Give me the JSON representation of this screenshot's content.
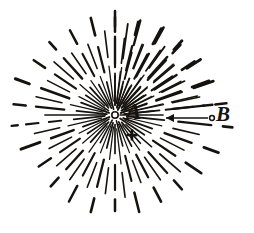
{
  "figure": {
    "kind": "engraving-diagram",
    "background_color": "#ffffff",
    "ink_color": "#16130f",
    "width": 254,
    "height": 233,
    "center": {
      "x": 115,
      "y": 115
    }
  },
  "labels": {
    "center_label": "A",
    "outer_label": "B"
  },
  "markers": {
    "center_node": {
      "name": "center-circle",
      "cx": 115,
      "cy": 115,
      "r": 3.2
    },
    "outer_node": {
      "name": "outer-circle",
      "cx": 212,
      "cy": 118,
      "r": 2.4
    },
    "plus_marker": {
      "name": "plus-marker",
      "x": 132,
      "y": 135,
      "size": 11
    }
  },
  "arrow": {
    "name": "direction-arrow",
    "from_x": 209,
    "from_y": 118,
    "to_x": 166,
    "to_y": 118,
    "head_length": 8,
    "head_width": 4
  },
  "chart_data": {
    "type": "scatter",
    "title": "",
    "xlabel": "",
    "ylabel": "",
    "rays": [
      {
        "angle": -90,
        "length": 104,
        "dashes": [
          [
            0.1,
            0.4
          ],
          [
            0.46,
            0.74
          ],
          [
            0.8,
            1.0
          ]
        ],
        "w": 1.5
      },
      {
        "angle": -82,
        "length": 92,
        "dashes": [
          [
            0.14,
            0.52
          ],
          [
            0.62,
            1.0
          ]
        ],
        "w": 1.1
      },
      {
        "angle": -75,
        "length": 98,
        "dashes": [
          [
            0.08,
            0.3
          ],
          [
            0.38,
            0.66
          ],
          [
            0.74,
            1.0
          ]
        ],
        "w": 1.4
      },
      {
        "angle": -68,
        "length": 86,
        "dashes": [
          [
            0.12,
            0.46
          ],
          [
            0.58,
            0.88
          ]
        ],
        "w": 1.0
      },
      {
        "angle": -61,
        "length": 100,
        "dashes": [
          [
            0.06,
            0.34
          ],
          [
            0.44,
            0.7
          ],
          [
            0.82,
            1.0
          ]
        ],
        "w": 1.6
      },
      {
        "angle": -54,
        "length": 88,
        "dashes": [
          [
            0.16,
            0.56
          ],
          [
            0.66,
            0.96
          ]
        ],
        "w": 1.1
      },
      {
        "angle": -47,
        "length": 96,
        "dashes": [
          [
            0.1,
            0.38
          ],
          [
            0.5,
            0.78
          ],
          [
            0.88,
            1.0
          ]
        ],
        "w": 1.5
      },
      {
        "angle": -40,
        "length": 84,
        "dashes": [
          [
            0.14,
            0.5
          ],
          [
            0.6,
            0.92
          ]
        ],
        "w": 1.0
      },
      {
        "angle": -33,
        "length": 102,
        "dashes": [
          [
            0.08,
            0.36
          ],
          [
            0.46,
            0.72
          ],
          [
            0.84,
            1.0
          ]
        ],
        "w": 1.7
      },
      {
        "angle": -26,
        "length": 90,
        "dashes": [
          [
            0.12,
            0.48
          ],
          [
            0.58,
            0.86
          ]
        ],
        "w": 1.1
      },
      {
        "angle": -19,
        "length": 104,
        "dashes": [
          [
            0.06,
            0.32
          ],
          [
            0.42,
            0.68
          ],
          [
            0.8,
            1.0
          ]
        ],
        "w": 1.6
      },
      {
        "angle": -12,
        "length": 92,
        "dashes": [
          [
            0.16,
            0.54
          ],
          [
            0.64,
            0.94
          ]
        ],
        "w": 1.0
      },
      {
        "angle": -6,
        "length": 112,
        "dashes": [
          [
            0.08,
            0.4
          ],
          [
            0.52,
            0.8
          ],
          [
            0.9,
            1.0
          ]
        ],
        "w": 1.5
      },
      {
        "angle": 0,
        "length": 48,
        "dashes": [
          [
            0.1,
            1.0
          ]
        ],
        "w": 1.0
      },
      {
        "angle": 6,
        "length": 118,
        "dashes": [
          [
            0.1,
            0.42
          ],
          [
            0.54,
            0.82
          ],
          [
            0.92,
            1.0
          ]
        ],
        "w": 1.6
      },
      {
        "angle": 13,
        "length": 96,
        "dashes": [
          [
            0.14,
            0.5
          ],
          [
            0.62,
            0.9
          ]
        ],
        "w": 1.0
      },
      {
        "angle": 20,
        "length": 110,
        "dashes": [
          [
            0.08,
            0.36
          ],
          [
            0.48,
            0.74
          ],
          [
            0.86,
            1.0
          ]
        ],
        "w": 1.7
      },
      {
        "angle": 27,
        "length": 88,
        "dashes": [
          [
            0.12,
            0.46
          ],
          [
            0.58,
            0.88
          ]
        ],
        "w": 1.0
      },
      {
        "angle": 34,
        "length": 104,
        "dashes": [
          [
            0.06,
            0.34
          ],
          [
            0.44,
            0.7
          ],
          [
            0.82,
            1.0
          ]
        ],
        "w": 1.6
      },
      {
        "angle": 41,
        "length": 90,
        "dashes": [
          [
            0.16,
            0.54
          ],
          [
            0.66,
            0.96
          ]
        ],
        "w": 1.1
      },
      {
        "angle": 48,
        "length": 100,
        "dashes": [
          [
            0.1,
            0.38
          ],
          [
            0.5,
            0.78
          ],
          [
            0.88,
            1.0
          ]
        ],
        "w": 1.5
      },
      {
        "angle": 55,
        "length": 86,
        "dashes": [
          [
            0.14,
            0.5
          ],
          [
            0.6,
            0.92
          ]
        ],
        "w": 1.0
      },
      {
        "angle": 62,
        "length": 98,
        "dashes": [
          [
            0.08,
            0.36
          ],
          [
            0.46,
            0.72
          ],
          [
            0.84,
            1.0
          ]
        ],
        "w": 1.6
      },
      {
        "angle": 69,
        "length": 84,
        "dashes": [
          [
            0.12,
            0.48
          ],
          [
            0.58,
            0.86
          ]
        ],
        "w": 1.0
      },
      {
        "angle": 76,
        "length": 100,
        "dashes": [
          [
            0.06,
            0.32
          ],
          [
            0.42,
            0.68
          ],
          [
            0.8,
            1.0
          ]
        ],
        "w": 1.5
      },
      {
        "angle": 83,
        "length": 88,
        "dashes": [
          [
            0.16,
            0.56
          ],
          [
            0.66,
            0.94
          ]
        ],
        "w": 1.0
      },
      {
        "angle": 90,
        "length": 96,
        "dashes": [
          [
            0.1,
            0.4
          ],
          [
            0.52,
            0.78
          ],
          [
            0.88,
            1.0
          ]
        ],
        "w": 1.5
      },
      {
        "angle": 97,
        "length": 86,
        "dashes": [
          [
            0.14,
            0.52
          ],
          [
            0.62,
            0.92
          ]
        ],
        "w": 1.0
      },
      {
        "angle": 104,
        "length": 100,
        "dashes": [
          [
            0.08,
            0.34
          ],
          [
            0.46,
            0.74
          ],
          [
            0.86,
            1.0
          ]
        ],
        "w": 1.6
      },
      {
        "angle": 111,
        "length": 88,
        "dashes": [
          [
            0.12,
            0.46
          ],
          [
            0.58,
            0.88
          ]
        ],
        "w": 1.0
      },
      {
        "angle": 118,
        "length": 98,
        "dashes": [
          [
            0.06,
            0.32
          ],
          [
            0.44,
            0.7
          ],
          [
            0.82,
            1.0
          ]
        ],
        "w": 1.5
      },
      {
        "angle": 125,
        "length": 84,
        "dashes": [
          [
            0.16,
            0.54
          ],
          [
            0.64,
            0.94
          ]
        ],
        "w": 1.0
      },
      {
        "angle": 132,
        "length": 96,
        "dashes": [
          [
            0.1,
            0.38
          ],
          [
            0.5,
            0.76
          ],
          [
            0.88,
            1.0
          ]
        ],
        "w": 1.6
      },
      {
        "angle": 139,
        "length": 86,
        "dashes": [
          [
            0.14,
            0.5
          ],
          [
            0.6,
            0.9
          ]
        ],
        "w": 1.0
      },
      {
        "angle": 146,
        "length": 92,
        "dashes": [
          [
            0.08,
            0.36
          ],
          [
            0.46,
            0.72
          ],
          [
            0.84,
            1.0
          ]
        ],
        "w": 1.5
      },
      {
        "angle": 153,
        "length": 84,
        "dashes": [
          [
            0.12,
            0.48
          ],
          [
            0.58,
            0.88
          ]
        ],
        "w": 1.0
      },
      {
        "angle": 160,
        "length": 100,
        "dashes": [
          [
            0.06,
            0.34
          ],
          [
            0.44,
            0.68
          ],
          [
            0.8,
            1.0
          ]
        ],
        "w": 1.8
      },
      {
        "angle": 167,
        "length": 86,
        "dashes": [
          [
            0.16,
            0.56
          ],
          [
            0.66,
            0.96
          ]
        ],
        "w": 1.0
      },
      {
        "angle": 174,
        "length": 104,
        "dashes": [
          [
            0.1,
            0.4
          ],
          [
            0.52,
            0.64
          ],
          [
            0.74,
            0.86
          ],
          [
            0.94,
            1.0
          ]
        ],
        "w": 1.4
      },
      {
        "angle": 180,
        "length": 70,
        "dashes": [
          [
            0.14,
            1.0
          ]
        ],
        "w": 1.0
      },
      {
        "angle": 186,
        "length": 102,
        "dashes": [
          [
            0.08,
            0.38
          ],
          [
            0.5,
            0.78
          ],
          [
            0.88,
            1.0
          ]
        ],
        "w": 1.5
      },
      {
        "angle": 193,
        "length": 88,
        "dashes": [
          [
            0.14,
            0.52
          ],
          [
            0.62,
            0.92
          ]
        ],
        "w": 1.0
      },
      {
        "angle": 200,
        "length": 106,
        "dashes": [
          [
            0.06,
            0.34
          ],
          [
            0.46,
            0.74
          ],
          [
            0.86,
            1.0
          ]
        ],
        "w": 1.8
      },
      {
        "angle": 207,
        "length": 88,
        "dashes": [
          [
            0.12,
            0.46
          ],
          [
            0.58,
            0.86
          ]
        ],
        "w": 1.0
      },
      {
        "angle": 214,
        "length": 98,
        "dashes": [
          [
            0.08,
            0.36
          ],
          [
            0.48,
            0.74
          ],
          [
            0.86,
            1.0
          ]
        ],
        "w": 1.5
      },
      {
        "angle": 221,
        "length": 86,
        "dashes": [
          [
            0.16,
            0.54
          ],
          [
            0.64,
            0.94
          ]
        ],
        "w": 1.0
      },
      {
        "angle": 228,
        "length": 98,
        "dashes": [
          [
            0.1,
            0.38
          ],
          [
            0.5,
            0.78
          ],
          [
            0.9,
            1.0
          ]
        ],
        "w": 1.6
      },
      {
        "angle": 235,
        "length": 84,
        "dashes": [
          [
            0.14,
            0.5
          ],
          [
            0.6,
            0.9
          ]
        ],
        "w": 1.0
      },
      {
        "angle": 242,
        "length": 96,
        "dashes": [
          [
            0.08,
            0.36
          ],
          [
            0.46,
            0.72
          ],
          [
            0.84,
            1.0
          ]
        ],
        "w": 1.5
      },
      {
        "angle": 249,
        "length": 86,
        "dashes": [
          [
            0.12,
            0.48
          ],
          [
            0.58,
            0.88
          ]
        ],
        "w": 1.0
      },
      {
        "angle": 256,
        "length": 100,
        "dashes": [
          [
            0.06,
            0.34
          ],
          [
            0.44,
            0.7
          ],
          [
            0.82,
            1.0
          ]
        ],
        "w": 1.6
      },
      {
        "angle": 263,
        "length": 88,
        "dashes": [
          [
            0.16,
            0.56
          ],
          [
            0.66,
            0.96
          ]
        ],
        "w": 1.0
      },
      {
        "angle": 270,
        "length": 98,
        "dashes": [
          [
            0.1,
            0.4
          ],
          [
            0.52,
            0.8
          ],
          [
            0.9,
            1.0
          ]
        ],
        "w": 1.5
      },
      {
        "angle": 277,
        "length": 84,
        "dashes": [
          [
            0.14,
            0.52
          ],
          [
            0.62,
            0.92
          ]
        ],
        "w": 1.0
      },
      {
        "angle": 284,
        "length": 96,
        "dashes": [
          [
            0.08,
            0.36
          ],
          [
            0.48,
            0.74
          ],
          [
            0.86,
            1.0
          ]
        ],
        "w": 1.6
      },
      {
        "angle": 291,
        "length": 86,
        "dashes": [
          [
            0.12,
            0.46
          ],
          [
            0.58,
            0.88
          ]
        ],
        "w": 1.0
      },
      {
        "angle": 298,
        "length": 98,
        "dashes": [
          [
            0.06,
            0.32
          ],
          [
            0.42,
            0.7
          ],
          [
            0.82,
            1.0
          ]
        ],
        "w": 1.5
      },
      {
        "angle": 305,
        "length": 84,
        "dashes": [
          [
            0.16,
            0.54
          ],
          [
            0.64,
            0.94
          ]
        ],
        "w": 1.0
      },
      {
        "angle": 312,
        "length": 100,
        "dashes": [
          [
            0.1,
            0.38
          ],
          [
            0.5,
            0.78
          ],
          [
            0.88,
            1.0
          ]
        ],
        "w": 1.7
      },
      {
        "angle": 319,
        "length": 86,
        "dashes": [
          [
            0.14,
            0.5
          ],
          [
            0.6,
            0.9
          ]
        ],
        "w": 1.0
      },
      {
        "angle": 326,
        "length": 96,
        "dashes": [
          [
            0.08,
            0.36
          ],
          [
            0.46,
            0.72
          ],
          [
            0.84,
            1.0
          ]
        ],
        "w": 1.5
      },
      {
        "angle": 333,
        "length": 86,
        "dashes": [
          [
            0.12,
            0.48
          ],
          [
            0.58,
            0.86
          ]
        ],
        "w": 1.0
      },
      {
        "angle": 340,
        "length": 100,
        "dashes": [
          [
            0.06,
            0.34
          ],
          [
            0.44,
            0.7
          ],
          [
            0.82,
            1.0
          ]
        ],
        "w": 1.6
      },
      {
        "angle": 347,
        "length": 88,
        "dashes": [
          [
            0.16,
            0.56
          ],
          [
            0.66,
            0.96
          ]
        ],
        "w": 1.0
      },
      {
        "angle": 354,
        "length": 98,
        "dashes": [
          [
            0.1,
            0.4
          ],
          [
            0.52,
            0.8
          ],
          [
            0.9,
            1.0
          ]
        ],
        "w": 1.4
      }
    ]
  }
}
